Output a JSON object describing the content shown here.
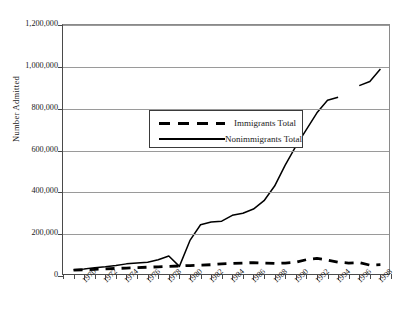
{
  "chart_data": {
    "type": "line",
    "title": "",
    "xlabel": "",
    "ylabel": "Number Admitted",
    "ylim": [
      0,
      1200000
    ],
    "ytick_values": [
      0,
      200000,
      400000,
      600000,
      800000,
      1000000,
      1200000
    ],
    "ytick_labels": [
      "0",
      "200,000",
      "400,000",
      "600,000",
      "800,000",
      "1,000,000",
      "1,200,000"
    ],
    "xlim": [
      1968,
      1999
    ],
    "x": [
      1969,
      1970,
      1971,
      1972,
      1973,
      1974,
      1975,
      1976,
      1977,
      1978,
      1979,
      1980,
      1981,
      1982,
      1983,
      1984,
      1985,
      1986,
      1987,
      1988,
      1989,
      1990,
      1991,
      1992,
      1993,
      1994,
      1995,
      1996,
      1997,
      1998
    ],
    "xtick_labels": [
      "1970",
      "1972",
      "1974",
      "1976",
      "1978",
      "1980",
      "1982",
      "1984",
      "1986",
      "1988",
      "1990",
      "1992",
      "1994",
      "1996",
      "1998"
    ],
    "xtick_values": [
      1970,
      1972,
      1974,
      1976,
      1978,
      1980,
      1982,
      1984,
      1986,
      1988,
      1990,
      1992,
      1994,
      1996,
      1998
    ],
    "minor_ticks_every": 1,
    "grid": true,
    "grid_axis": "y",
    "legend_position": "upper-left-inside",
    "series": [
      {
        "name": "Immigrants Total",
        "style": "dashed",
        "values": [
          28000,
          30000,
          32000,
          34000,
          36000,
          38000,
          40000,
          42000,
          44000,
          46000,
          48000,
          50000,
          52000,
          54000,
          58000,
          60000,
          62000,
          64000,
          62000,
          60000,
          62000,
          66000,
          78000,
          84000,
          76000,
          66000,
          62000,
          64000,
          52000,
          54000
        ]
      },
      {
        "name": "Nonimmigrants Total",
        "style": "solid",
        "values": [
          30000,
          34000,
          40000,
          44000,
          50000,
          58000,
          62000,
          66000,
          78000,
          96000,
          46000,
          170000,
          245000,
          258000,
          262000,
          290000,
          300000,
          320000,
          360000,
          430000,
          530000,
          620000,
          700000,
          780000,
          840000,
          855000,
          null,
          910000,
          930000,
          990000
        ]
      }
    ]
  }
}
